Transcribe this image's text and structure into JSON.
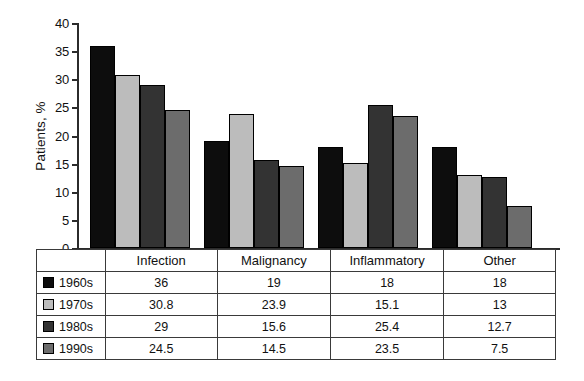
{
  "chart_data": {
    "type": "bar",
    "title": "",
    "xlabel": "",
    "ylabel": "Patients, %",
    "ylim": [
      0,
      40
    ],
    "ytick_step": 5,
    "yticks": [
      0,
      5,
      10,
      15,
      20,
      25,
      30,
      35,
      40
    ],
    "ytick_labels": [
      "0",
      "5",
      "10",
      "15",
      "20",
      "25",
      "30",
      "35",
      "40"
    ],
    "grid": false,
    "legend_position": "table-first-column",
    "categories": [
      "Infection",
      "Malignancy",
      "Inflammatory",
      "Other"
    ],
    "series": [
      {
        "name": "1960s",
        "color": "#0d0d0d",
        "values": [
          36,
          19,
          18,
          18
        ]
      },
      {
        "name": "1970s",
        "color": "#bcbcbc",
        "values": [
          30.8,
          23.9,
          15.1,
          13
        ]
      },
      {
        "name": "1980s",
        "color": "#333333",
        "values": [
          29,
          15.6,
          25.4,
          12.7
        ]
      },
      {
        "name": "1990s",
        "color": "#6c6c6c",
        "values": [
          24.5,
          14.5,
          23.5,
          7.5
        ]
      }
    ]
  },
  "table": {
    "header": {
      "legend_corner_label": "",
      "columns": [
        "Infection",
        "Malignancy",
        "Inflammatory",
        "Other"
      ]
    },
    "rows": [
      {
        "label": "1960s",
        "swatch": "#0d0d0d",
        "cells": [
          "36",
          "19",
          "18",
          "18"
        ]
      },
      {
        "label": "1970s",
        "swatch": "#bcbcbc",
        "cells": [
          "30.8",
          "23.9",
          "15.1",
          "13"
        ]
      },
      {
        "label": "1980s",
        "swatch": "#333333",
        "cells": [
          "29",
          "15.6",
          "25.4",
          "12.7"
        ]
      },
      {
        "label": "1990s",
        "swatch": "#6c6c6c",
        "cells": [
          "24.5",
          "14.5",
          "23.5",
          "7.5"
        ]
      }
    ]
  },
  "axis": {
    "y_title": "Patients, %",
    "y_labels": [
      "40",
      "35",
      "30",
      "25",
      "20",
      "15",
      "10",
      "5",
      "0"
    ]
  }
}
